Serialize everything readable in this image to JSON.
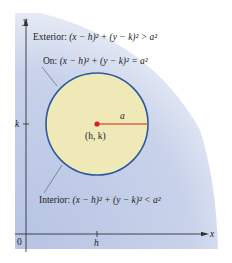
{
  "diagram": {
    "axes": {
      "x_label": "x",
      "y_label": "y",
      "origin_label": "0",
      "x_tick_label": "h",
      "y_tick_label": "k"
    },
    "circle": {
      "center_label": "(h, k)",
      "radius_label": "a"
    },
    "labels": {
      "exterior_prefix": "Exterior: ",
      "exterior_eq": "(x − h)² + (y − k)² > a²",
      "on_prefix": "On: ",
      "on_eq": "(x − h)² + (y − k)² = a²",
      "interior_prefix": "Interior: ",
      "interior_eq": "(x − h)² + (y − k)² < a²"
    },
    "colors": {
      "exterior_fill": "#c9d3ea",
      "exterior_fill_edge": "#e6ebf5",
      "interior_fill": "#efe9b8",
      "circle_stroke": "#2c5aa0",
      "radius_line": "#d9604a",
      "center_dot": "#d42020",
      "axis": "#333333"
    }
  }
}
